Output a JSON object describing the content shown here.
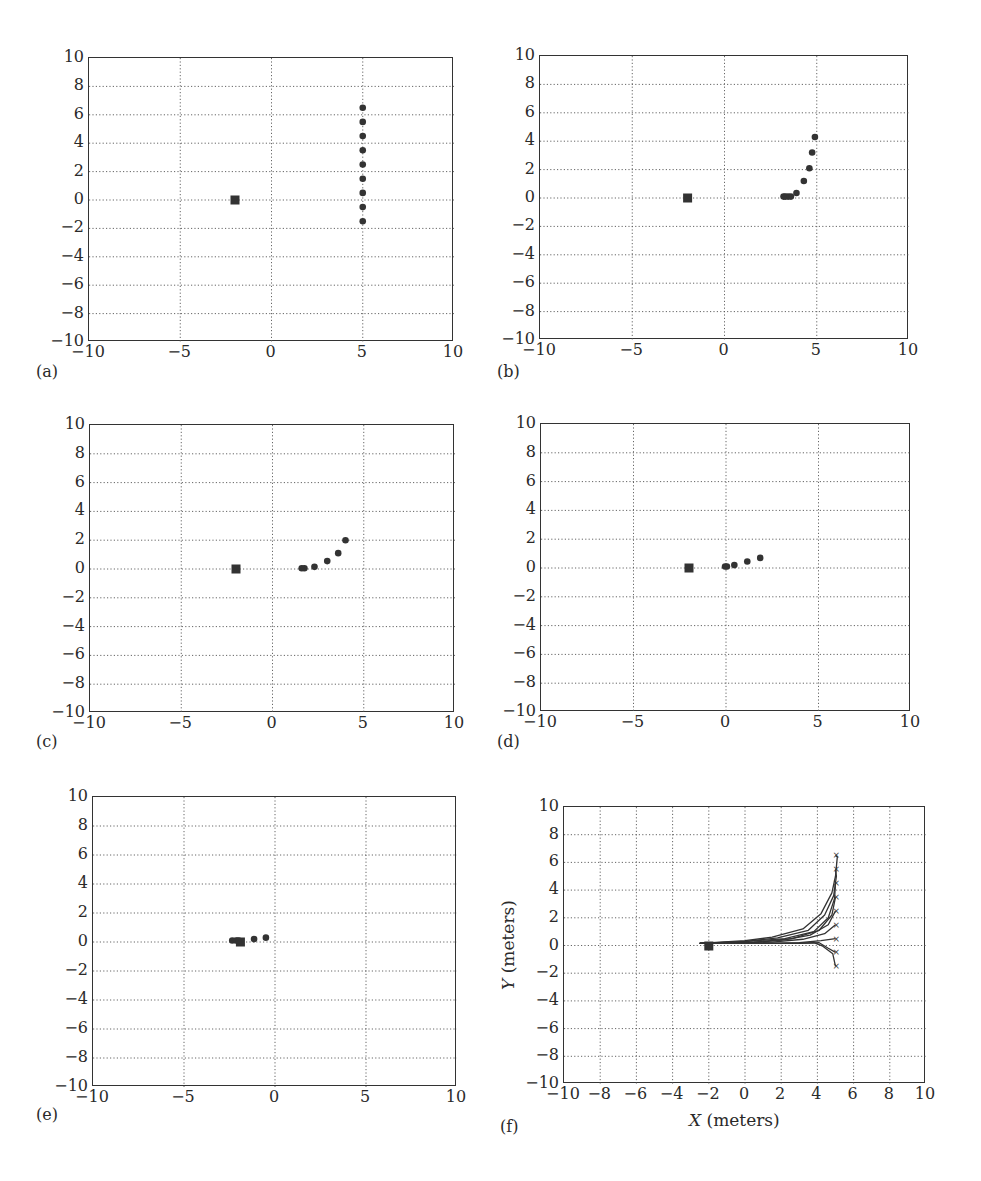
{
  "chart_data": [
    {
      "type": "scatter",
      "panel_label": "(a)",
      "title": "",
      "xlabel": "",
      "ylabel": "",
      "xlim": [
        -10,
        10
      ],
      "ylim": [
        -10,
        10
      ],
      "x_ticks": [
        "−10",
        "−5",
        "0",
        "5",
        "10"
      ],
      "y_ticks": [
        "10",
        "8",
        "6",
        "4",
        "2",
        "0",
        "−2",
        "−4",
        "−6",
        "−8",
        "−10"
      ],
      "grid": "dotted",
      "series": [
        {
          "name": "target",
          "marker": "square",
          "points": [
            [
              -2,
              0
            ]
          ]
        },
        {
          "name": "agents",
          "marker": "circle",
          "points": [
            [
              5,
              6.5
            ],
            [
              5,
              5.5
            ],
            [
              5,
              4.5
            ],
            [
              5,
              3.5
            ],
            [
              5,
              2.5
            ],
            [
              5,
              1.5
            ],
            [
              5,
              0.5
            ],
            [
              5,
              -0.5
            ],
            [
              5,
              -1.5
            ]
          ]
        }
      ]
    },
    {
      "type": "scatter",
      "panel_label": "(b)",
      "title": "",
      "xlabel": "",
      "ylabel": "",
      "xlim": [
        -10,
        10
      ],
      "ylim": [
        -10,
        10
      ],
      "x_ticks": [
        "−10",
        "−5",
        "0",
        "5",
        "10"
      ],
      "y_ticks": [
        "10",
        "8",
        "6",
        "4",
        "2",
        "0",
        "−2",
        "−4",
        "−6",
        "−8",
        "−10"
      ],
      "grid": "dotted",
      "series": [
        {
          "name": "target",
          "marker": "square",
          "points": [
            [
              -2,
              0
            ]
          ]
        },
        {
          "name": "agents",
          "marker": "circle",
          "points": [
            [
              4.9,
              4.3
            ],
            [
              4.75,
              3.2
            ],
            [
              4.6,
              2.1
            ],
            [
              4.3,
              1.2
            ],
            [
              3.9,
              0.35
            ],
            [
              3.6,
              0.1
            ],
            [
              3.45,
              0.1
            ],
            [
              3.3,
              0.1
            ],
            [
              3.2,
              0.1
            ]
          ]
        }
      ]
    },
    {
      "type": "scatter",
      "panel_label": "(c)",
      "title": "",
      "xlabel": "",
      "ylabel": "",
      "xlim": [
        -10,
        10
      ],
      "ylim": [
        -10,
        10
      ],
      "x_ticks": [
        "−10",
        "−5",
        "0",
        "5",
        "10"
      ],
      "y_ticks": [
        "10",
        "8",
        "6",
        "4",
        "2",
        "0",
        "−2",
        "−4",
        "−6",
        "−8",
        "−10"
      ],
      "grid": "dotted",
      "series": [
        {
          "name": "target",
          "marker": "square",
          "points": [
            [
              -2,
              0
            ]
          ]
        },
        {
          "name": "agents",
          "marker": "circle",
          "points": [
            [
              4.0,
              2.0
            ],
            [
              3.6,
              1.1
            ],
            [
              3.0,
              0.55
            ],
            [
              2.3,
              0.15
            ],
            [
              1.75,
              0.05
            ],
            [
              1.6,
              0.05
            ]
          ]
        }
      ]
    },
    {
      "type": "scatter",
      "panel_label": "(d)",
      "title": "",
      "xlabel": "",
      "ylabel": "",
      "xlim": [
        -10,
        10
      ],
      "ylim": [
        -10,
        10
      ],
      "x_ticks": [
        "−10",
        "−5",
        "0",
        "5",
        "10"
      ],
      "y_ticks": [
        "10",
        "8",
        "6",
        "4",
        "2",
        "0",
        "−2",
        "−4",
        "−6",
        "−8",
        "−10"
      ],
      "grid": "dotted",
      "series": [
        {
          "name": "target",
          "marker": "square",
          "points": [
            [
              -2,
              0
            ]
          ]
        },
        {
          "name": "agents",
          "marker": "circle",
          "points": [
            [
              1.85,
              0.7
            ],
            [
              1.15,
              0.45
            ],
            [
              0.45,
              0.2
            ],
            [
              0.05,
              0.1
            ],
            [
              -0.05,
              0.1
            ]
          ]
        }
      ]
    },
    {
      "type": "scatter",
      "panel_label": "(e)",
      "title": "",
      "xlabel": "",
      "ylabel": "",
      "xlim": [
        -10,
        10
      ],
      "ylim": [
        -10,
        10
      ],
      "x_ticks": [
        "−10",
        "−5",
        "0",
        "5",
        "10"
      ],
      "y_ticks": [
        "10",
        "8",
        "6",
        "4",
        "2",
        "0",
        "−2",
        "−4",
        "−6",
        "−8",
        "−10"
      ],
      "grid": "dotted",
      "series": [
        {
          "name": "target",
          "marker": "square",
          "points": [
            [
              -1.9,
              0
            ]
          ]
        },
        {
          "name": "agents",
          "marker": "circle",
          "points": [
            [
              -0.5,
              0.3
            ],
            [
              -1.15,
              0.2
            ],
            [
              -2.35,
              0.1
            ],
            [
              -2.15,
              0.1
            ],
            [
              -2.0,
              0.1
            ]
          ]
        }
      ]
    },
    {
      "type": "line",
      "panel_label": "(f)",
      "title": "",
      "xlabel": "X (meters)",
      "ylabel": "Y (meters)",
      "xlim": [
        -10,
        10
      ],
      "ylim": [
        -10,
        10
      ],
      "x_ticks": [
        "−10",
        "−8",
        "−6",
        "−4",
        "−2",
        "0",
        "2",
        "4",
        "6",
        "8",
        "10"
      ],
      "y_ticks": [
        "10",
        "8",
        "6",
        "4",
        "2",
        "0",
        "−2",
        "−4",
        "−6",
        "−8",
        "−10"
      ],
      "grid": "dotted",
      "target": [
        -2,
        0
      ],
      "series": [
        {
          "name": "traj-1",
          "start": [
            5,
            6.5
          ],
          "points": [
            [
              5,
              6.5
            ],
            [
              5.1,
              6.4
            ],
            [
              5.0,
              5.0
            ],
            [
              4.8,
              3.8
            ],
            [
              4.2,
              2.3
            ],
            [
              3.2,
              1.2
            ],
            [
              1.5,
              0.6
            ],
            [
              0,
              0.35
            ],
            [
              -2.5,
              0.15
            ]
          ]
        },
        {
          "name": "traj-2",
          "start": [
            5,
            5.5
          ],
          "points": [
            [
              5,
              5.5
            ],
            [
              5.05,
              5.0
            ],
            [
              4.9,
              3.6
            ],
            [
              4.4,
              2.2
            ],
            [
              3.5,
              1.1
            ],
            [
              1.8,
              0.55
            ],
            [
              0,
              0.3
            ],
            [
              -2.5,
              0.15
            ]
          ]
        },
        {
          "name": "traj-3",
          "start": [
            5,
            4.5
          ],
          "points": [
            [
              5,
              4.5
            ],
            [
              4.95,
              3.4
            ],
            [
              4.6,
              2.0
            ],
            [
              3.8,
              1.0
            ],
            [
              2.2,
              0.5
            ],
            [
              0,
              0.28
            ],
            [
              -2.5,
              0.15
            ]
          ]
        },
        {
          "name": "traj-4",
          "start": [
            5,
            3.5
          ],
          "points": [
            [
              5,
              3.5
            ],
            [
              4.8,
              2.2
            ],
            [
              4.1,
              1.1
            ],
            [
              2.6,
              0.5
            ],
            [
              0.5,
              0.25
            ],
            [
              -2.5,
              0.15
            ]
          ]
        },
        {
          "name": "traj-5",
          "start": [
            5,
            2.5
          ],
          "points": [
            [
              5,
              2.5
            ],
            [
              4.6,
              1.5
            ],
            [
              3.6,
              0.75
            ],
            [
              2.2,
              0.4
            ],
            [
              0.5,
              0.22
            ],
            [
              -2.5,
              0.15
            ]
          ]
        },
        {
          "name": "traj-6",
          "start": [
            5,
            1.5
          ],
          "points": [
            [
              5,
              1.5
            ],
            [
              4.4,
              0.85
            ],
            [
              3.2,
              0.45
            ],
            [
              1.5,
              0.25
            ],
            [
              -2.5,
              0.15
            ]
          ]
        },
        {
          "name": "traj-7",
          "start": [
            5,
            0.5
          ],
          "points": [
            [
              5,
              0.5
            ],
            [
              4.2,
              0.35
            ],
            [
              3.0,
              0.2
            ],
            [
              1.0,
              0.15
            ],
            [
              -2.5,
              0.15
            ]
          ]
        },
        {
          "name": "traj-8",
          "start": [
            5,
            -0.5
          ],
          "points": [
            [
              5,
              -0.5
            ],
            [
              4.6,
              -0.2
            ],
            [
              4.1,
              0.2
            ],
            [
              3.0,
              0.15
            ],
            [
              1.0,
              0.15
            ],
            [
              -2.5,
              0.15
            ]
          ]
        },
        {
          "name": "traj-9",
          "start": [
            5,
            -1.5
          ],
          "points": [
            [
              5,
              -1.5
            ],
            [
              4.85,
              -0.6
            ],
            [
              4.3,
              -0.05
            ],
            [
              3.8,
              0.2
            ],
            [
              2.5,
              0.15
            ],
            [
              -2.5,
              0.15
            ]
          ]
        }
      ]
    }
  ],
  "colors": {
    "axis": "#333333",
    "grid": "#555555",
    "marker": "#333333",
    "background": "#ffffff"
  }
}
